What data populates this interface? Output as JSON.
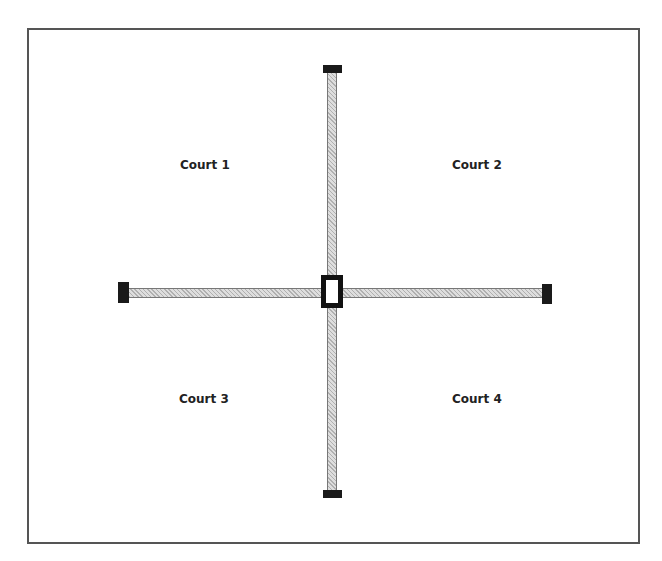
{
  "diagram": {
    "type": "court-layout",
    "courts": [
      {
        "id": 1,
        "label": "Court 1",
        "position": "top-left"
      },
      {
        "id": 2,
        "label": "Court 2",
        "position": "top-right"
      },
      {
        "id": 3,
        "label": "Court 3",
        "position": "bottom-left"
      },
      {
        "id": 4,
        "label": "Court 4",
        "position": "bottom-right"
      }
    ],
    "dividers": [
      {
        "orientation": "vertical",
        "end_posts": [
          "top",
          "bottom"
        ]
      },
      {
        "orientation": "horizontal",
        "end_posts": [
          "left",
          "right"
        ]
      }
    ],
    "center_post": {
      "shape": "rectangle",
      "style": "hollow"
    }
  },
  "colors": {
    "frame": "#555555",
    "bar_fill": "#c8c8c8",
    "post": "#1a1a1a",
    "label": "#222222",
    "background": "#ffffff"
  }
}
